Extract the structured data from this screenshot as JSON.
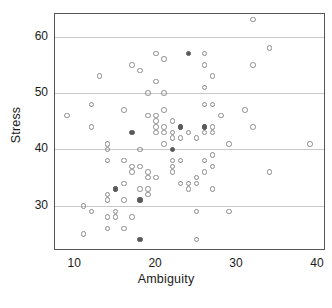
{
  "figure": {
    "background": "#ffffff",
    "frame_color": "#555555",
    "grid_color": "#c8c8c8",
    "marker_open_color": "#8a8a8a",
    "marker_fill_color": "#5a5a5a",
    "caption_fragment": ""
  },
  "chart_data": {
    "type": "scatter",
    "title": "",
    "xlabel": "Ambiguity",
    "ylabel": "Stress",
    "xlim": [
      7.5,
      41
    ],
    "ylim": [
      22,
      64
    ],
    "xticks": [
      10,
      20,
      30,
      40
    ],
    "yticks": [
      30,
      40,
      50,
      60
    ],
    "grid": "horizontal",
    "legend": "none",
    "marker": "open-circle",
    "series": [
      {
        "name": "respondents",
        "marker": "open-circle",
        "points": [
          [
            9,
            46
          ],
          [
            11,
            30
          ],
          [
            11,
            25
          ],
          [
            12,
            48
          ],
          [
            12,
            44
          ],
          [
            12,
            29
          ],
          [
            13,
            53
          ],
          [
            14,
            40
          ],
          [
            14,
            41
          ],
          [
            14,
            38
          ],
          [
            14,
            32
          ],
          [
            14,
            31
          ],
          [
            14,
            28
          ],
          [
            14,
            26
          ],
          [
            15,
            33
          ],
          [
            15,
            29
          ],
          [
            15,
            28
          ],
          [
            16,
            47
          ],
          [
            16,
            38
          ],
          [
            16,
            34
          ],
          [
            16,
            31
          ],
          [
            16,
            26
          ],
          [
            17,
            55
          ],
          [
            17,
            37
          ],
          [
            17,
            36
          ],
          [
            17,
            28
          ],
          [
            18,
            54
          ],
          [
            18,
            40
          ],
          [
            18,
            37
          ],
          [
            18,
            33
          ],
          [
            18,
            31
          ],
          [
            19,
            50
          ],
          [
            19,
            46
          ],
          [
            19,
            36
          ],
          [
            19,
            35
          ],
          [
            19,
            33
          ],
          [
            19,
            32
          ],
          [
            20,
            57
          ],
          [
            20,
            52
          ],
          [
            20,
            46
          ],
          [
            20,
            45
          ],
          [
            20,
            44
          ],
          [
            20,
            43
          ],
          [
            20,
            35
          ],
          [
            21,
            56
          ],
          [
            21,
            50
          ],
          [
            21,
            47
          ],
          [
            21,
            44
          ],
          [
            21,
            43
          ],
          [
            21,
            41
          ],
          [
            22,
            45
          ],
          [
            22,
            43
          ],
          [
            22,
            42
          ],
          [
            22,
            38
          ],
          [
            22,
            37
          ],
          [
            22,
            36
          ],
          [
            23,
            44
          ],
          [
            23,
            42
          ],
          [
            23,
            38
          ],
          [
            23,
            34
          ],
          [
            24,
            43
          ],
          [
            24,
            34
          ],
          [
            24,
            33
          ],
          [
            25,
            42
          ],
          [
            25,
            35
          ],
          [
            25,
            34
          ],
          [
            25,
            29
          ],
          [
            25,
            24
          ],
          [
            26,
            57
          ],
          [
            26,
            55
          ],
          [
            26,
            51
          ],
          [
            26,
            48
          ],
          [
            26,
            44
          ],
          [
            26,
            43
          ],
          [
            26,
            38
          ],
          [
            26,
            36
          ],
          [
            27,
            53
          ],
          [
            27,
            48
          ],
          [
            27,
            44
          ],
          [
            27,
            43
          ],
          [
            27,
            39
          ],
          [
            27,
            37
          ],
          [
            27,
            33
          ],
          [
            28,
            46
          ],
          [
            29,
            41
          ],
          [
            29,
            29
          ],
          [
            31,
            47
          ],
          [
            32,
            63
          ],
          [
            32,
            55
          ],
          [
            32,
            44
          ],
          [
            34,
            58
          ],
          [
            34,
            36
          ],
          [
            39,
            41
          ]
        ]
      },
      {
        "name": "respondents-overplotted",
        "marker": "filled-circle",
        "points": [
          [
            15,
            33
          ],
          [
            17,
            43
          ],
          [
            18,
            31
          ],
          [
            18,
            24
          ],
          [
            22,
            40
          ],
          [
            23,
            44
          ],
          [
            24,
            57
          ],
          [
            26,
            44
          ]
        ]
      }
    ]
  }
}
